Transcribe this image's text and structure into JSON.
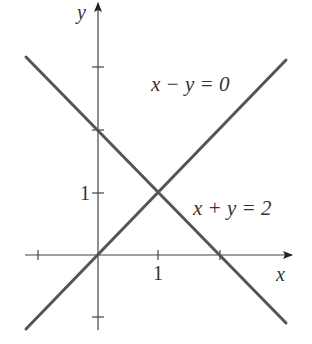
{
  "figure": {
    "axes": {
      "x_label": "x",
      "y_label": "y",
      "x_tick_label": "1",
      "y_tick_label": "1",
      "x_ticks": [
        -1,
        1,
        2
      ],
      "y_ticks": [
        -1,
        1,
        2,
        3
      ]
    },
    "lines": [
      {
        "equation": "x − y = 0",
        "label": "x − y = 0",
        "color": "#555555"
      },
      {
        "equation": "x + y = 2",
        "label": "x + y = 2",
        "color": "#555555"
      }
    ],
    "intersection": {
      "x": 1,
      "y": 1
    },
    "colors": {
      "line": "#555555",
      "axis": "#444444",
      "text": "#333333"
    }
  }
}
